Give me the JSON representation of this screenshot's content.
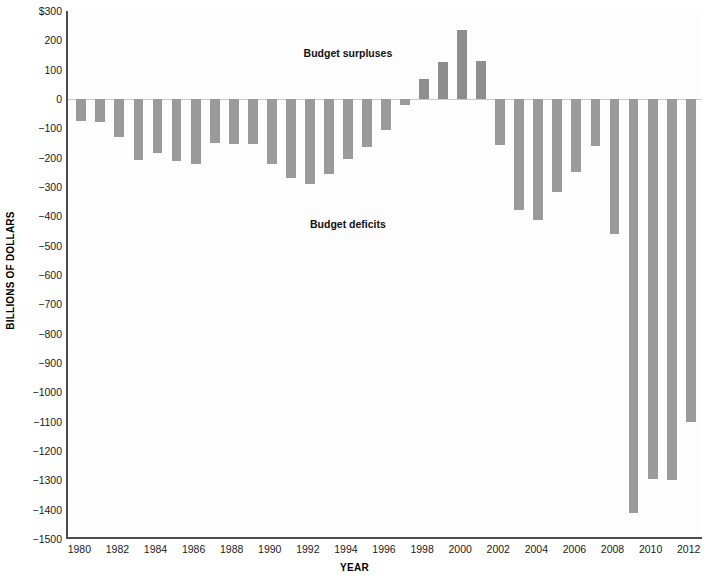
{
  "chart_data": {
    "type": "bar",
    "title": "",
    "xlabel": "YEAR",
    "ylabel": "BILLIONS OF DOLLARS",
    "ylim": [
      -1500,
      300
    ],
    "xlim": [
      1979.3,
      2012.7
    ],
    "grid": false,
    "legend_position": "none",
    "bar_color": "#9a9a9a",
    "y_ticks": [
      {
        "value": 300,
        "label": "$300"
      },
      {
        "value": 200,
        "label": "200"
      },
      {
        "value": 100,
        "label": "100"
      },
      {
        "value": 0,
        "label": "0"
      },
      {
        "value": -100,
        "label": "−100"
      },
      {
        "value": -200,
        "label": "−200"
      },
      {
        "value": -300,
        "label": "−300"
      },
      {
        "value": -400,
        "label": "−400"
      },
      {
        "value": -500,
        "label": "−500"
      },
      {
        "value": -600,
        "label": "−600"
      },
      {
        "value": -700,
        "label": "−700"
      },
      {
        "value": -800,
        "label": "−800"
      },
      {
        "value": -900,
        "label": "−900"
      },
      {
        "value": -1000,
        "label": "−1000"
      },
      {
        "value": -1100,
        "label": "−1100"
      },
      {
        "value": -1200,
        "label": "−1200"
      },
      {
        "value": -1300,
        "label": "−1300"
      },
      {
        "value": -1400,
        "label": "−1400"
      },
      {
        "value": -1500,
        "label": "−1500"
      }
    ],
    "x_ticks": [
      {
        "value": 1980,
        "label": "1980"
      },
      {
        "value": 1982,
        "label": "1982"
      },
      {
        "value": 1984,
        "label": "1984"
      },
      {
        "value": 1986,
        "label": "1986"
      },
      {
        "value": 1988,
        "label": "1988"
      },
      {
        "value": 1990,
        "label": "1990"
      },
      {
        "value": 1992,
        "label": "1992"
      },
      {
        "value": 1994,
        "label": "1994"
      },
      {
        "value": 1996,
        "label": "1996"
      },
      {
        "value": 1998,
        "label": "1998"
      },
      {
        "value": 2000,
        "label": "2000"
      },
      {
        "value": 2002,
        "label": "2002"
      },
      {
        "value": 2004,
        "label": "2004"
      },
      {
        "value": 2006,
        "label": "2006"
      },
      {
        "value": 2008,
        "label": "2008"
      },
      {
        "value": 2010,
        "label": "2010"
      },
      {
        "value": 2012,
        "label": "2012"
      }
    ],
    "categories": [
      1980,
      1981,
      1982,
      1983,
      1984,
      1985,
      1986,
      1987,
      1988,
      1989,
      1990,
      1991,
      1992,
      1993,
      1994,
      1995,
      1996,
      1997,
      1998,
      1999,
      2000,
      2001,
      2002,
      2003,
      2004,
      2005,
      2006,
      2007,
      2008,
      2009,
      2010,
      2011,
      2012
    ],
    "values": [
      -74,
      -79,
      -128,
      -208,
      -185,
      -212,
      -221,
      -150,
      -155,
      -153,
      -221,
      -269,
      -290,
      -255,
      -203,
      -164,
      -107,
      -22,
      69,
      126,
      236,
      128,
      -158,
      -378,
      -413,
      -318,
      -248,
      -161,
      -459,
      -1413,
      -1294,
      -1300,
      -1100
    ],
    "annotations": [
      {
        "text": "Budget surpluses",
        "x": 1994.0,
        "y": 155
      },
      {
        "text": "Budget deficits",
        "x": 1994.0,
        "y": -430
      }
    ]
  }
}
